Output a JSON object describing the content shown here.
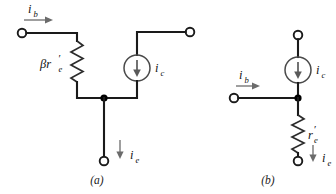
{
  "figure": {
    "background_color": "#ffffff",
    "wire_color": "#1a1a1a",
    "source_color": "#5a5a5a",
    "arrow_color": "#6b6b6b"
  },
  "circuit_a": {
    "caption": "(a)",
    "base_current": {
      "symbol": "i",
      "subscript": "b"
    },
    "collector_current": {
      "symbol": "i",
      "subscript": "c"
    },
    "emitter_current": {
      "symbol": "i",
      "subscript": "e"
    },
    "resistor": {
      "symbol": "βr",
      "subscript": "e",
      "prime": "′",
      "full": "βr′e"
    },
    "source_type": "current-source",
    "source_direction": "down",
    "terminals": [
      "base",
      "collector",
      "emitter"
    ]
  },
  "circuit_b": {
    "caption": "(b)",
    "base_current": {
      "symbol": "i",
      "subscript": "b"
    },
    "collector_current": {
      "symbol": "i",
      "subscript": "c"
    },
    "emitter_current": {
      "symbol": "i",
      "subscript": "e"
    },
    "resistor": {
      "symbol": "r",
      "subscript": "e",
      "prime": "′",
      "full": "r′e"
    },
    "source_type": "current-source",
    "source_direction": "down",
    "terminals": [
      "base",
      "collector",
      "emitter"
    ]
  }
}
